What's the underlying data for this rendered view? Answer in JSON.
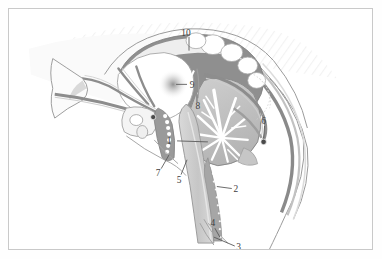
{
  "figure": {
    "kind": "anatomical-illustration",
    "style": "grayscale line and wash drawing",
    "frame": {
      "border_color": "#c9c9c9",
      "background": "#ffffff"
    },
    "palette": {
      "outline": "#6e6e6e",
      "dark_gray": "#8d8d8d",
      "mid_gray": "#b0b0b0",
      "light_gray": "#d4d4d4",
      "pale_gray": "#e8e8e8",
      "white": "#ffffff",
      "label_text": "#3d3d3d",
      "leader_line": "#5a5a5a",
      "marker_dark": "#4a4a4a"
    },
    "labels": [
      {
        "id": "label-1",
        "text": "1",
        "x": 161,
        "y": 133,
        "leader_to_x": 200,
        "leader_to_y": 134
      },
      {
        "id": "label-2",
        "text": "2",
        "x": 227,
        "y": 182,
        "leader_to_x": 209,
        "leader_to_y": 179
      },
      {
        "id": "label-3",
        "text": "3",
        "x": 230,
        "y": 241,
        "leader_to_x": 206,
        "leader_to_y": 230
      },
      {
        "id": "label-4",
        "text": "4",
        "x": 205,
        "y": 218,
        "leader_to_x": 212,
        "leader_to_y": 230
      },
      {
        "id": "label-5",
        "text": "5",
        "x": 171,
        "y": 172,
        "leader_to_x": 179,
        "leader_to_y": 152
      },
      {
        "id": "label-6",
        "text": "6",
        "x": 255,
        "y": 115,
        "leader_to_x": 256,
        "leader_to_y": 131
      },
      {
        "id": "label-7",
        "text": "7",
        "x": 150,
        "y": 165,
        "leader_to_x": 161,
        "leader_to_y": 147
      },
      {
        "id": "label-8",
        "text": "8",
        "x": 189,
        "y": 97,
        "leader_to_x": 189,
        "leader_to_y": 88
      },
      {
        "id": "label-9",
        "text": "9",
        "x": 182,
        "y": 77,
        "leader_to_x": 168,
        "leader_to_y": 76
      },
      {
        "id": "label-10",
        "text": "10",
        "x": 175,
        "y": 25,
        "leader_to_x": 180,
        "leader_to_y": 42
      }
    ],
    "markers": [
      {
        "id": "marker-left",
        "x": 145,
        "y": 109,
        "r": 2.6
      },
      {
        "id": "marker-right",
        "x": 256,
        "y": 134,
        "r": 2.8
      }
    ]
  }
}
